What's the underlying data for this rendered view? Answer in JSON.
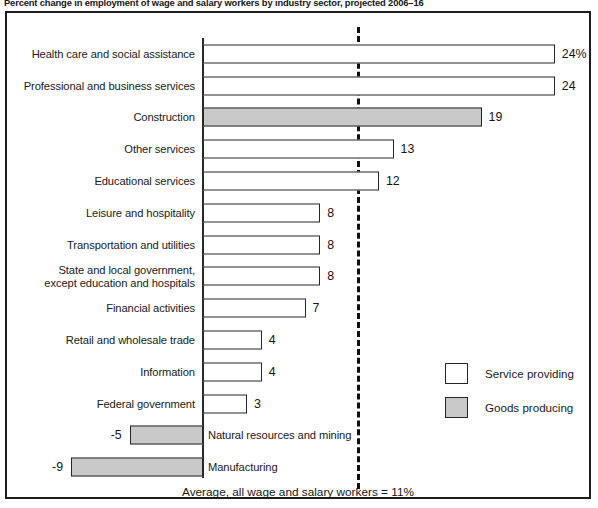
{
  "chart_title": "Percent change in employment of wage and salary workers by industry sector, projected 2006–16",
  "legend": {
    "items": [
      {
        "label": "Service providing",
        "color": "#ffffff",
        "key": "service"
      },
      {
        "label": "Goods producing",
        "color": "#c9c9c9",
        "key": "goods"
      }
    ]
  },
  "average_caption": "Average, all wage and salary workers = 11%",
  "chart_data": {
    "type": "bar",
    "orientation": "horizontal",
    "title": "Percent change in employment of wage and salary workers by industry sector, projected 2006–16",
    "xlabel": "",
    "ylabel": "",
    "xlim": [
      -9,
      24
    ],
    "grid": false,
    "legend_position": "inside-right",
    "reference_line": {
      "value": 11,
      "label": "Average, all wage and salary workers = 11%",
      "style": "dashed"
    },
    "categories": [
      "Health care and social assistance",
      "Professional and business services",
      "Construction",
      "Other services",
      "Educational services",
      "Leisure and hospitality",
      "Transportation and utilities",
      "State and local government, except education and hospitals",
      "Financial activities",
      "Retail and wholesale trade",
      "Information",
      "Federal government",
      "Natural resources and mining",
      "Manufacturing"
    ],
    "values": [
      24,
      24,
      19,
      13,
      12,
      8,
      8,
      8,
      7,
      4,
      4,
      3,
      -5,
      -9
    ],
    "value_labels": [
      "24%",
      "24",
      "19",
      "13",
      "12",
      "8",
      "8",
      "8",
      "7",
      "4",
      "4",
      "3",
      "-5",
      "-9"
    ],
    "groups": [
      "service",
      "service",
      "goods",
      "service",
      "service",
      "service",
      "service",
      "service",
      "service",
      "service",
      "service",
      "service",
      "goods",
      "goods"
    ]
  },
  "rows": [
    {
      "label_line1": "Health care and social assistance",
      "label_line2": "",
      "value_label": "24%",
      "group": "service",
      "negative": false
    },
    {
      "label_line1": "Professional and business services",
      "label_line2": "",
      "value_label": "24",
      "group": "service",
      "negative": false
    },
    {
      "label_line1": "Construction",
      "label_line2": "",
      "value_label": "19",
      "group": "goods",
      "negative": false
    },
    {
      "label_line1": "Other services",
      "label_line2": "",
      "value_label": "13",
      "group": "service",
      "negative": false
    },
    {
      "label_line1": "Educational services",
      "label_line2": "",
      "value_label": "12",
      "group": "service",
      "negative": false
    },
    {
      "label_line1": "Leisure and hospitality",
      "label_line2": "",
      "value_label": "8",
      "group": "service",
      "negative": false
    },
    {
      "label_line1": "Transportation and utilities",
      "label_line2": "",
      "value_label": "8",
      "group": "service",
      "negative": false
    },
    {
      "label_line1": "State and local government,",
      "label_line2": "except education and hospitals",
      "value_label": "8",
      "group": "service",
      "negative": false
    },
    {
      "label_line1": "Financial activities",
      "label_line2": "",
      "value_label": "7",
      "group": "service",
      "negative": false
    },
    {
      "label_line1": "Retail and wholesale trade",
      "label_line2": "",
      "value_label": "4",
      "group": "service",
      "negative": false
    },
    {
      "label_line1": "Information",
      "label_line2": "",
      "value_label": "4",
      "group": "service",
      "negative": false
    },
    {
      "label_line1": "Federal government",
      "label_line2": "",
      "value_label": "3",
      "group": "service",
      "negative": false
    },
    {
      "label_line1": "Natural resources and mining",
      "label_line2": "",
      "value_label": "-5",
      "group": "goods",
      "negative": true
    },
    {
      "label_line1": "Manufacturing",
      "label_line2": "",
      "value_label": "-9",
      "group": "goods",
      "negative": true
    }
  ]
}
